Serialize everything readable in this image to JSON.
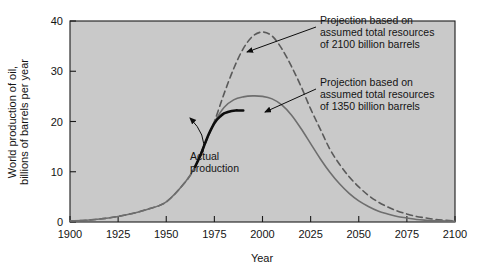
{
  "chart_data": {
    "type": "line",
    "title": "",
    "xlabel": "Year",
    "ylabel": "World production of oil, billions of barrels per year",
    "ylabel_line1": "World production of oil,",
    "ylabel_line2": "billions of barrels per year",
    "xlim": [
      1900,
      2100
    ],
    "ylim": [
      0,
      40
    ],
    "xticks": [
      1900,
      1925,
      1950,
      1975,
      2000,
      2025,
      2050,
      2075,
      2100
    ],
    "yticks": [
      0,
      10,
      20,
      30,
      40
    ],
    "grid": false,
    "legend_position": "none",
    "plot_background": "#c9c9c9",
    "page_background": "#ffffff",
    "series": [
      {
        "name": "Projection based on assumed total resources of 2100 billion barrels",
        "style": "dashed",
        "color": "#5a5a5a",
        "width": 1.6,
        "x": [
          1900,
          1910,
          1920,
          1930,
          1940,
          1950,
          1960,
          1965,
          1970,
          1975,
          1980,
          1985,
          1990,
          1995,
          2000,
          2005,
          2010,
          2015,
          2020,
          2025,
          2030,
          2035,
          2040,
          2045,
          2050,
          2055,
          2060,
          2065,
          2070,
          2075,
          2080,
          2085,
          2090,
          2095,
          2100
        ],
        "y": [
          0.2,
          0.4,
          0.8,
          1.5,
          2.5,
          4.0,
          8.0,
          11.0,
          15.5,
          20.0,
          25.5,
          30.5,
          34.5,
          37.0,
          37.8,
          37.0,
          34.5,
          31.0,
          27.0,
          22.5,
          18.5,
          14.5,
          11.5,
          9.0,
          7.0,
          5.3,
          4.0,
          3.0,
          2.2,
          1.6,
          1.1,
          0.8,
          0.5,
          0.35,
          0.2
        ]
      },
      {
        "name": "Projection based on assumed total resources of 1350 billion barrels",
        "style": "solid",
        "color": "#6e6e6e",
        "width": 1.6,
        "x": [
          1900,
          1910,
          1920,
          1930,
          1940,
          1950,
          1960,
          1965,
          1970,
          1975,
          1980,
          1985,
          1990,
          1995,
          2000,
          2005,
          2010,
          2015,
          2020,
          2025,
          2030,
          2035,
          2040,
          2045,
          2050,
          2055,
          2060,
          2065,
          2070,
          2075,
          2080,
          2085,
          2090,
          2095,
          2100
        ],
        "y": [
          0.2,
          0.4,
          0.8,
          1.5,
          2.5,
          4.0,
          8.0,
          11.0,
          15.5,
          19.8,
          22.8,
          24.3,
          24.9,
          25.1,
          25.0,
          24.5,
          23.3,
          21.3,
          18.6,
          15.6,
          12.6,
          9.9,
          7.6,
          5.7,
          4.2,
          3.1,
          2.2,
          1.6,
          1.1,
          0.8,
          0.5,
          0.35,
          0.25,
          0.2,
          0.15
        ]
      },
      {
        "name": "Actual production",
        "style": "solid-bold",
        "color": "#0d0d0d",
        "width": 2.6,
        "x": [
          1965,
          1968,
          1970,
          1972,
          1974,
          1976,
          1978,
          1980,
          1982,
          1984,
          1986,
          1988,
          1990
        ],
        "y": [
          11.0,
          13.5,
          15.5,
          17.4,
          19.0,
          20.2,
          21.0,
          21.6,
          21.9,
          22.1,
          22.2,
          22.2,
          22.2
        ]
      }
    ],
    "annotations": [
      {
        "id": "annotation-2100-billion",
        "lines": [
          "Projection based on",
          "assumed total resources",
          "of 2100 billion barrels"
        ],
        "text_x": 320,
        "text_y": 24,
        "arrow_from": [
          316,
          27
        ],
        "arrow_to": [
          247,
          52
        ]
      },
      {
        "id": "annotation-1350-billion",
        "lines": [
          "Projection based on",
          "assumed total resources",
          "of 1350 billion barrels"
        ],
        "text_x": 320,
        "text_y": 86,
        "arrow_from": [
          316,
          89
        ],
        "arrow_to": [
          265,
          112
        ]
      },
      {
        "id": "annotation-actual-production",
        "lines": [
          "Actual",
          "production"
        ],
        "text_x": 190,
        "text_y": 160,
        "arrow_from": [
          203,
          152
        ],
        "arrow_to": [
          190,
          118
        ]
      }
    ]
  }
}
